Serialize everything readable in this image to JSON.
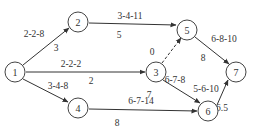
{
  "diagram": {
    "type": "activity-network",
    "nodes": [
      {
        "id": "1",
        "label": "1",
        "x": 15,
        "y": 72
      },
      {
        "id": "2",
        "label": "2",
        "x": 78,
        "y": 22
      },
      {
        "id": "3",
        "label": "3",
        "x": 156,
        "y": 72
      },
      {
        "id": "4",
        "label": "4",
        "x": 78,
        "y": 108
      },
      {
        "id": "5",
        "label": "5",
        "x": 187,
        "y": 30
      },
      {
        "id": "6",
        "label": "6",
        "x": 208,
        "y": 111
      },
      {
        "id": "7",
        "label": "7",
        "x": 236,
        "y": 72
      }
    ],
    "edges": [
      {
        "from": "1",
        "to": "2",
        "estimate": "2-2-8",
        "expected": "3",
        "dashed": false
      },
      {
        "from": "1",
        "to": "3",
        "estimate": "2-2-2",
        "expected": "2",
        "dashed": false
      },
      {
        "from": "1",
        "to": "4",
        "estimate": "3-4-8",
        "expected": "",
        "dashed": false
      },
      {
        "from": "2",
        "to": "5",
        "estimate": "3-4-11",
        "expected": "5",
        "dashed": false
      },
      {
        "from": "3",
        "to": "5",
        "estimate": "0",
        "expected": "",
        "dashed": true
      },
      {
        "from": "3",
        "to": "6",
        "estimate": "6-7-8",
        "expected": "7",
        "dashed": false
      },
      {
        "from": "4",
        "to": "6",
        "estimate": "6-7-14",
        "expected": "8",
        "dashed": false
      },
      {
        "from": "5",
        "to": "7",
        "estimate": "6-8-10",
        "expected": "8",
        "dashed": false
      },
      {
        "from": "6",
        "to": "7",
        "estimate": "5-6-10",
        "expected": "6.5",
        "dashed": false
      }
    ],
    "labels": {
      "e12_est": "2-2-8",
      "e12_exp": "3",
      "e13_est": "2-2-2",
      "e13_exp": "2",
      "e14_est": "3-4-8",
      "e25_est": "3-4-11",
      "e25_exp": "5",
      "e35_est": "0",
      "e36_est": "6-7-8",
      "e36_exp": "7",
      "e46_est": "6-7-14",
      "e46_exp": "8",
      "e57_est": "6-8-10",
      "e57_exp": "8",
      "e67_est": "5-6-10",
      "e67_exp": "6.5"
    },
    "node_labels": {
      "n1": "1",
      "n2": "2",
      "n3": "3",
      "n4": "4",
      "n5": "5",
      "n6": "6",
      "n7": "7"
    }
  }
}
